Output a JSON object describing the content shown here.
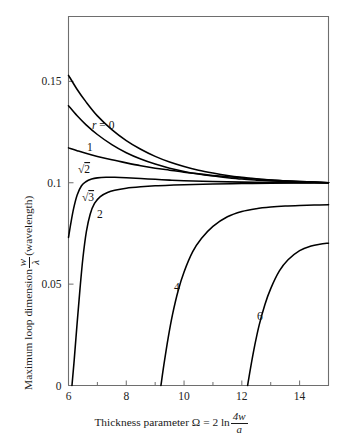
{
  "figure": {
    "title": "",
    "background_color": "#ffffff",
    "frame_color": "#6e6e6e",
    "curve_color": "#000000"
  },
  "axes": {
    "x": {
      "label_plain": "Thickness parameter Ω = 2 ln 4w/a",
      "label_prefix": "Thickness parameter Ω = 2 ln",
      "label_numerator": "4w",
      "label_denominator": "a",
      "ticks": [
        6,
        8,
        10,
        12,
        14
      ],
      "tick_labels": [
        "6",
        "8",
        "10",
        "12",
        "14"
      ],
      "minor_ticks": [
        7,
        9,
        11,
        13,
        15
      ],
      "range": [
        6,
        15
      ]
    },
    "y": {
      "label_plain": "Maximum loop dimension w/λ (wavelength)",
      "label_prefix": "Maximum loop dimension",
      "label_numerator": "w",
      "label_denominator": "λ",
      "label_suffix": "(wavelength)",
      "ticks": [
        0,
        0.05,
        0.1,
        0.15
      ],
      "tick_labels": [
        "0",
        "0.05",
        "0.1",
        "0.15"
      ],
      "range": [
        0,
        0.182
      ]
    }
  },
  "curve_labels": [
    {
      "key": "r0",
      "text": "r = 0",
      "x": 92,
      "y": 129
    },
    {
      "key": "r1",
      "text": "1",
      "x": 87,
      "y": 151
    },
    {
      "key": "rsqrt2",
      "text": "√2",
      "x": 78,
      "y": 173
    },
    {
      "key": "rsqrt3",
      "text": "√3",
      "x": 82,
      "y": 201
    },
    {
      "key": "r2",
      "text": "2",
      "x": 97,
      "y": 218
    },
    {
      "key": "r4",
      "text": "4",
      "x": 174,
      "y": 291
    },
    {
      "key": "r6",
      "text": "6",
      "x": 257,
      "y": 320
    }
  ],
  "chart_data": {
    "type": "line",
    "title": "",
    "xlabel": "Thickness parameter Ω = 2 ln 4w/a",
    "ylabel": "Maximum loop dimension w/λ (wavelength)",
    "xlim": [
      6,
      15
    ],
    "ylim": [
      0,
      0.182
    ],
    "xticks": [
      6,
      8,
      10,
      12,
      14
    ],
    "yticks": [
      0,
      0.05,
      0.1,
      0.15
    ],
    "grid": false,
    "legend": "inline-curve-labels",
    "series": [
      {
        "name": "r = 0",
        "label": "r = 0",
        "x": [
          6.0,
          6.3,
          6.6,
          7.0,
          7.5,
          8.0,
          8.5,
          9.0,
          9.5,
          10.0,
          10.5,
          11.0,
          11.5,
          12.0,
          12.5,
          13.0,
          13.5,
          14.0,
          14.5,
          15.0
        ],
        "y": [
          0.153,
          0.146,
          0.14,
          0.133,
          0.1262,
          0.1208,
          0.1165,
          0.113,
          0.1102,
          0.108,
          0.1062,
          0.1048,
          0.1036,
          0.1027,
          0.102,
          0.1014,
          0.101,
          0.1006,
          0.1003,
          0.1
        ]
      },
      {
        "name": "1",
        "label": "1",
        "x": [
          6.0,
          6.3,
          6.6,
          7.0,
          7.5,
          8.0,
          8.5,
          9.0,
          9.5,
          10.0,
          10.5,
          11.0,
          11.5,
          12.0,
          12.5,
          13.0,
          13.5,
          14.0,
          14.5,
          15.0
        ],
        "y": [
          0.138,
          0.133,
          0.1287,
          0.1238,
          0.1188,
          0.1148,
          0.1117,
          0.1092,
          0.1072,
          0.1056,
          0.1043,
          0.1033,
          0.1025,
          0.1018,
          0.1013,
          0.1009,
          0.1006,
          0.1004,
          0.1002,
          0.1
        ]
      },
      {
        "name": "√2",
        "label": "√2",
        "x": [
          6.0,
          6.3,
          6.6,
          7.0,
          7.5,
          8.0,
          8.5,
          9.0,
          9.5,
          10.0,
          10.5,
          11.0,
          11.5,
          12.0,
          12.5,
          13.0,
          13.5,
          14.0,
          14.5,
          15.0
        ],
        "y": [
          0.1172,
          0.1158,
          0.1145,
          0.113,
          0.1113,
          0.1098,
          0.1084,
          0.1072,
          0.1062,
          0.1052,
          0.1044,
          0.1036,
          0.103,
          0.1024,
          0.1018,
          0.1013,
          0.1009,
          0.1006,
          0.1003,
          0.1
        ]
      },
      {
        "name": "√3",
        "label": "√3",
        "x": [
          6.0,
          6.08,
          6.18,
          6.3,
          6.45,
          6.6,
          6.8,
          7.0,
          7.3,
          7.6,
          8.0,
          8.5,
          9.0,
          9.5,
          10.0,
          11.0,
          12.0,
          13.0,
          14.0,
          15.0
        ],
        "y": [
          0.073,
          0.08,
          0.0875,
          0.094,
          0.0985,
          0.1005,
          0.1018,
          0.1024,
          0.1027,
          0.1027,
          0.1025,
          0.1021,
          0.1017,
          0.1013,
          0.101,
          0.1006,
          0.1003,
          0.1001,
          0.1,
          0.1
        ]
      },
      {
        "name": "2",
        "label": "2",
        "x": [
          6.12,
          6.2,
          6.3,
          6.4,
          6.5,
          6.62,
          6.75,
          6.9,
          7.1,
          7.35,
          7.6,
          8.0,
          8.5,
          9.0,
          9.5,
          10.0,
          11.0,
          12.0,
          13.0,
          14.0,
          15.0
        ],
        "y": [
          0.0,
          0.013,
          0.031,
          0.048,
          0.063,
          0.076,
          0.0845,
          0.0898,
          0.0932,
          0.0952,
          0.0963,
          0.0973,
          0.098,
          0.0985,
          0.0988,
          0.099,
          0.0994,
          0.0996,
          0.0998,
          0.0999,
          0.1
        ]
      },
      {
        "name": "4",
        "label": "4",
        "x": [
          9.2,
          9.3,
          9.45,
          9.6,
          9.8,
          10.0,
          10.3,
          10.6,
          11.0,
          11.5,
          12.0,
          12.5,
          13.0,
          13.5,
          14.0,
          14.5,
          15.0
        ],
        "y": [
          0.0,
          0.01,
          0.0235,
          0.035,
          0.047,
          0.056,
          0.066,
          0.0725,
          0.0785,
          0.0832,
          0.0858,
          0.0872,
          0.088,
          0.0885,
          0.0888,
          0.089,
          0.0892
        ]
      },
      {
        "name": "6",
        "label": "6",
        "x": [
          12.2,
          12.3,
          12.45,
          12.6,
          12.8,
          13.0,
          13.3,
          13.6,
          14.0,
          14.4,
          14.7,
          15.0
        ],
        "y": [
          0.0,
          0.0085,
          0.02,
          0.0298,
          0.04,
          0.0478,
          0.0565,
          0.062,
          0.0665,
          0.0688,
          0.0697,
          0.0702
        ]
      }
    ]
  }
}
